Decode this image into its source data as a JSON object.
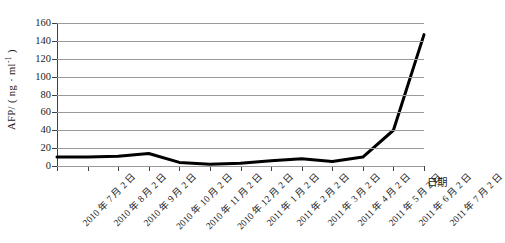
{
  "chart_data": {
    "type": "line",
    "title": "",
    "xlabel": "日期",
    "ylabel": "AFP/(ng·ml⁻¹)",
    "ylabel_main": "AFP/ ( ng · ml",
    "ylabel_sup": "-1",
    "ylabel_tail": " )",
    "ylim": [
      0,
      160
    ],
    "ytick_step": 20,
    "yticks": [
      0,
      20,
      40,
      60,
      80,
      100,
      120,
      140,
      160
    ],
    "grid": "horizontal",
    "legend": "none",
    "line_color": "#000000",
    "grid_color": "#9a9a9a",
    "axis_color": "#404040",
    "categories": [
      "2010 年 7 月 2 日",
      "2010 年 8 月 2 日",
      "2010 年 9 月 2 日",
      "2010 年 10 月 2 日",
      "2010 年 11 月 2 日",
      "2010 年 12 月 2 日",
      "2011 年 1 月 2 日",
      "2011 年 2 月 2 日",
      "2011 年 3 月 2 日",
      "2011 年 4 月 2 日",
      "2011 年 5 月 2 日",
      "2011 年 6 月 2 日",
      "2011 年 7 月 2 日"
    ],
    "values": [
      10,
      10,
      11,
      14,
      4,
      2,
      3,
      6,
      8,
      5,
      10,
      40,
      147
    ],
    "series": [
      {
        "name": "AFP",
        "values": [
          10,
          10,
          11,
          14,
          4,
          2,
          3,
          6,
          8,
          5,
          10,
          40,
          147
        ]
      }
    ]
  }
}
